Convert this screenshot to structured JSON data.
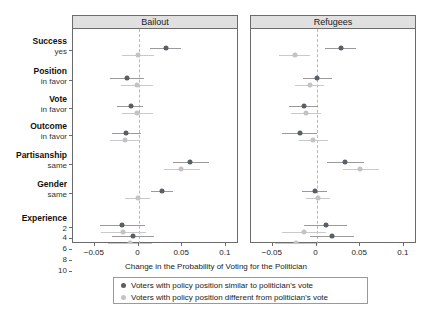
{
  "chart_data": {
    "type": "scatter",
    "plot_style": "dot-whisker coefficient plot",
    "title": "",
    "xlabel": "Change in the Probability of Voting for the Politician",
    "ylabel": "",
    "xlim": [
      -0.075,
      0.115
    ],
    "xticks": [
      -0.05,
      0,
      0.05,
      0.1
    ],
    "xticklabels": [
      "−0.05",
      "0",
      "0.05",
      "0.1"
    ],
    "grid": false,
    "reference_line": 0,
    "panels": [
      {
        "id": "bailout",
        "label": "Bailout"
      },
      {
        "id": "refugees",
        "label": "Refugees"
      }
    ],
    "legend": {
      "position": "bottom",
      "entries": [
        {
          "key": "similar",
          "label": "Voters with policy position similar to politician's vote",
          "color": "#5a5f66",
          "marker": "circle"
        },
        {
          "key": "different",
          "label": "Voters with policy position different from politician's vote",
          "color": "#c3c3c3",
          "marker": "circle"
        }
      ]
    },
    "categories": [
      {
        "group": "Success",
        "level": "yes"
      },
      {
        "group": "Position",
        "level": "in favor"
      },
      {
        "group": "Vote",
        "level": "in favor"
      },
      {
        "group": "Outcome",
        "level": "in favor"
      },
      {
        "group": "Partisanship",
        "level": "same"
      },
      {
        "group": "Gender",
        "level": "same"
      },
      {
        "group": "Experience",
        "level": "2"
      },
      {
        "group": "",
        "level": "4"
      },
      {
        "group": "",
        "level": "6"
      },
      {
        "group": "",
        "level": "8"
      },
      {
        "group": "",
        "level": "10"
      }
    ],
    "series": [
      {
        "panel": "bailout",
        "name": "Voters with policy position similar to politician's vote",
        "color": "#5a5f66",
        "points": [
          {
            "category": "Success yes",
            "estimate": 0.031,
            "ci_low": 0.0135,
            "ci_high": 0.049
          },
          {
            "category": "Position in favor",
            "estimate": -0.013,
            "ci_low": -0.033,
            "ci_high": 0.0065
          },
          {
            "category": "Vote in favor",
            "estimate": -0.0085,
            "ci_low": -0.025,
            "ci_high": 0.005
          },
          {
            "category": "Outcome in favor",
            "estimate": -0.014,
            "ci_low": -0.03,
            "ci_high": 0.003
          },
          {
            "category": "Partisanship same",
            "estimate": 0.059,
            "ci_low": 0.039,
            "ci_high": 0.081
          },
          {
            "category": "Gender same",
            "estimate": 0.027,
            "ci_low": 0.014,
            "ci_high": 0.04
          },
          {
            "category": "Experience 2",
            "estimate": -0.019,
            "ci_low": -0.044,
            "ci_high": 0.0075
          },
          {
            "category": "Experience 4",
            "estimate": -0.006,
            "ci_low": -0.03,
            "ci_high": 0.018
          },
          {
            "category": "Experience 6",
            "estimate": -0.016,
            "ci_low": -0.039,
            "ci_high": 0.0075
          },
          {
            "category": "Experience 8",
            "estimate": -0.03,
            "ci_low": -0.054,
            "ci_high": -0.006
          },
          {
            "category": "Experience 10",
            "estimate": -0.017,
            "ci_low": -0.042,
            "ci_high": 0.008
          }
        ]
      },
      {
        "panel": "bailout",
        "name": "Voters with policy position different from politician's vote",
        "color": "#c3c3c3",
        "points": [
          {
            "category": "Success yes",
            "estimate": -0.0005,
            "ci_low": -0.019,
            "ci_high": 0.018
          },
          {
            "category": "Position in favor",
            "estimate": -0.002,
            "ci_low": -0.02,
            "ci_high": 0.017
          },
          {
            "category": "Vote in favor",
            "estimate": -0.0015,
            "ci_low": -0.019,
            "ci_high": 0.017
          },
          {
            "category": "Outcome in favor",
            "estimate": -0.016,
            "ci_low": -0.033,
            "ci_high": 0.002
          },
          {
            "category": "Partisanship same",
            "estimate": 0.049,
            "ci_low": 0.029,
            "ci_high": 0.07
          },
          {
            "category": "Gender same",
            "estimate": -0.001,
            "ci_low": -0.015,
            "ci_high": 0.013
          },
          {
            "category": "Experience 2",
            "estimate": -0.018,
            "ci_low": -0.043,
            "ci_high": 0.0085
          },
          {
            "category": "Experience 4",
            "estimate": -0.0095,
            "ci_low": -0.035,
            "ci_high": 0.015
          },
          {
            "category": "Experience 6",
            "estimate": -0.0125,
            "ci_low": -0.037,
            "ci_high": 0.012
          },
          {
            "category": "Experience 8",
            "estimate": -0.014,
            "ci_low": -0.039,
            "ci_high": 0.011
          },
          {
            "category": "Experience 10",
            "estimate": 0.024,
            "ci_low": -0.001,
            "ci_high": 0.049
          }
        ]
      },
      {
        "panel": "refugees",
        "name": "Voters with policy position similar to politician's vote",
        "color": "#5a5f66",
        "points": [
          {
            "category": "Success yes",
            "estimate": 0.028,
            "ci_low": 0.01,
            "ci_high": 0.045
          },
          {
            "category": "Position in favor",
            "estimate": 0.001,
            "ci_low": -0.015,
            "ci_high": 0.018
          },
          {
            "category": "Vote in favor",
            "estimate": -0.014,
            "ci_low": -0.031,
            "ci_high": 0.002
          },
          {
            "category": "Outcome in favor",
            "estimate": -0.019,
            "ci_low": -0.04,
            "ci_high": 0.001
          },
          {
            "category": "Partisanship same",
            "estimate": 0.033,
            "ci_low": 0.012,
            "ci_high": 0.054
          },
          {
            "category": "Gender same",
            "estimate": -0.002,
            "ci_low": -0.017,
            "ci_high": 0.012
          },
          {
            "category": "Experience 2",
            "estimate": 0.011,
            "ci_low": -0.014,
            "ci_high": 0.035
          },
          {
            "category": "Experience 4",
            "estimate": 0.0175,
            "ci_low": -0.0075,
            "ci_high": 0.043
          },
          {
            "category": "Experience 6",
            "estimate": 0.0115,
            "ci_low": -0.0135,
            "ci_high": 0.036
          },
          {
            "category": "Experience 8",
            "estimate": 0.011,
            "ci_low": -0.014,
            "ci_high": 0.036
          },
          {
            "category": "Experience 10",
            "estimate": 0.011,
            "ci_low": -0.014,
            "ci_high": 0.036
          }
        ]
      },
      {
        "panel": "refugees",
        "name": "Voters with policy position different from politician's vote",
        "color": "#c3c3c3",
        "points": [
          {
            "category": "Success yes",
            "estimate": -0.025,
            "ci_low": -0.043,
            "ci_high": -0.007
          },
          {
            "category": "Position in favor",
            "estimate": -0.008,
            "ci_low": -0.025,
            "ci_high": 0.009
          },
          {
            "category": "Vote in favor",
            "estimate": -0.012,
            "ci_low": -0.029,
            "ci_high": 0.005
          },
          {
            "category": "Outcome in favor",
            "estimate": -0.004,
            "ci_low": -0.02,
            "ci_high": 0.013
          },
          {
            "category": "Partisanship same",
            "estimate": 0.05,
            "ci_low": 0.03,
            "ci_high": 0.071
          },
          {
            "category": "Gender same",
            "estimate": 0.002,
            "ci_low": -0.012,
            "ci_high": 0.016
          },
          {
            "category": "Experience 2",
            "estimate": -0.0145,
            "ci_low": -0.039,
            "ci_high": 0.0105
          },
          {
            "category": "Experience 4",
            "estimate": -0.023,
            "ci_low": -0.048,
            "ci_high": 0.002
          },
          {
            "category": "Experience 6",
            "estimate": 0.009,
            "ci_low": -0.016,
            "ci_high": 0.034
          },
          {
            "category": "Experience 8",
            "estimate": -0.015,
            "ci_low": -0.04,
            "ci_high": 0.01
          },
          {
            "category": "Experience 10",
            "estimate": -0.001,
            "ci_low": -0.026,
            "ci_high": 0.024
          }
        ]
      }
    ]
  }
}
